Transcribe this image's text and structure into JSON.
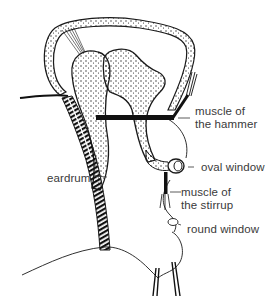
{
  "diagram": {
    "labels": {
      "muscle_hammer_1": "muscle of",
      "muscle_hammer_2": "the hammer",
      "oval_window": "oval window",
      "eardrum": "eardrum",
      "muscle_stirrup_1": "muscle of",
      "muscle_stirrup_2": "the stirrup",
      "round_window": "round window"
    },
    "colors": {
      "ink": "#1a1a1a",
      "text": "#3a3a3a",
      "background": "#ffffff"
    }
  }
}
